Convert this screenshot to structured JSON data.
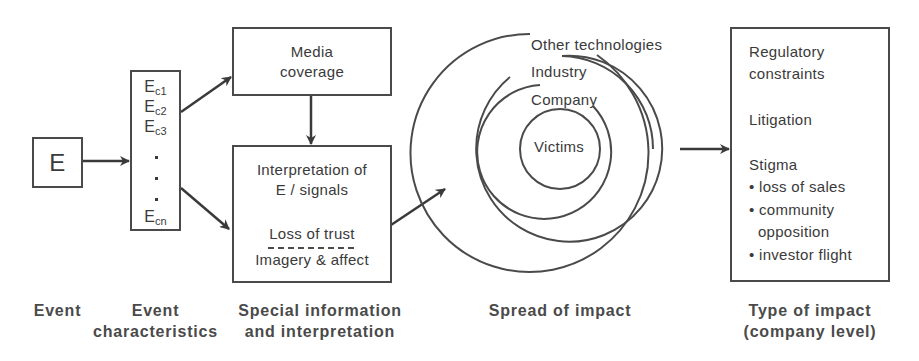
{
  "diagram": {
    "event_box": {
      "label": "E"
    },
    "characteristics_box": {
      "items": [
        {
          "base": "E",
          "sub": "c1"
        },
        {
          "base": "E",
          "sub": "c2"
        },
        {
          "base": "E",
          "sub": "c3"
        },
        {
          "base": "E",
          "sub": "cn"
        }
      ],
      "ellipsis": "· · ·"
    },
    "media_box": {
      "line1": "Media",
      "line2": "coverage"
    },
    "interpretation_box": {
      "line1": "Interpretation of",
      "line2": "E / signals",
      "line3": "Loss of trust",
      "line4": "Imagery & affect"
    },
    "spread_rings": {
      "outer": "Other technologies",
      "third": "Industry",
      "second": "Company",
      "inner": "Victims"
    },
    "impact_box": {
      "item1_line1": "Regulatory",
      "item1_line2": "constraints",
      "item2": "Litigation",
      "item3": "Stigma",
      "bullets": [
        "• loss of sales",
        "• community",
        "  opposition",
        "• investor flight"
      ]
    }
  },
  "captions": {
    "event": "Event",
    "characteristics_line1": "Event",
    "characteristics_line2": "characteristics",
    "special_line1": "Special information",
    "special_line2": "and interpretation",
    "spread": "Spread of impact",
    "type_line1": "Type of impact",
    "type_line2": "(company level)"
  },
  "colors": {
    "stroke": "#4a4a4a",
    "text": "#3a3a3a",
    "background": "#ffffff"
  }
}
